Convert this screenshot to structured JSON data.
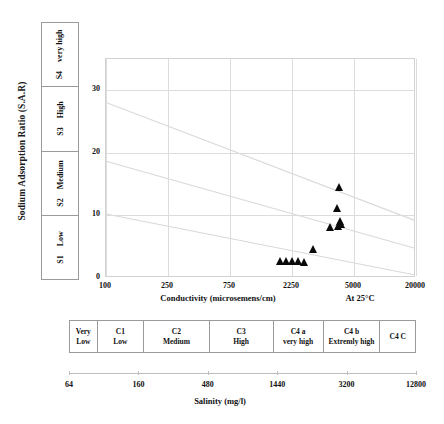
{
  "chart_data": {
    "type": "scatter",
    "title": "",
    "xlabel": "Conductivity (microsemens/cm)",
    "xlabel_extra": "At 25°C",
    "ylabel": "Sodium Adsorption Ratio (S.A.R)",
    "x_ticks": [
      "100",
      "250",
      "750",
      "2250",
      "5000",
      "20000"
    ],
    "x_tick_positions": [
      0,
      20,
      40,
      60,
      80,
      100
    ],
    "y_ticks": [
      "0",
      "10",
      "20",
      "30"
    ],
    "ylim": [
      0,
      35
    ],
    "grid": true,
    "legend": null,
    "secondary_axis": {
      "label": "Salinity (mg/l)",
      "ticks": [
        "64",
        "160",
        "480",
        "1440",
        "3200",
        "12800"
      ],
      "tick_positions": [
        0,
        20,
        40,
        60,
        80,
        100
      ]
    },
    "boundary_lines": [
      {
        "name": "S3-S4 boundary",
        "x0": 0,
        "y0": 28.0,
        "x1": 100,
        "y1": 9.0
      },
      {
        "name": "S2-S3 boundary",
        "x0": 0,
        "y0": 18.5,
        "x1": 100,
        "y1": 4.5
      },
      {
        "name": "S1-S2 boundary",
        "x0": 0,
        "y0": 10.0,
        "x1": 100,
        "y1": 0.2
      }
    ],
    "points": [
      {
        "x_pct": 56.2,
        "sar": 2.0
      },
      {
        "x_pct": 58.4,
        "sar": 2.1
      },
      {
        "x_pct": 60.3,
        "sar": 2.0
      },
      {
        "x_pct": 62.1,
        "sar": 2.1
      },
      {
        "x_pct": 64.2,
        "sar": 1.9
      },
      {
        "x_pct": 67.0,
        "sar": 4.0
      },
      {
        "x_pct": 72.5,
        "sar": 7.4
      },
      {
        "x_pct": 75.1,
        "sar": 7.6
      },
      {
        "x_pct": 75.6,
        "sar": 8.4
      },
      {
        "x_pct": 74.8,
        "sar": 10.5
      },
      {
        "x_pct": 75.4,
        "sar": 13.8
      },
      {
        "x_pct": 76.0,
        "sar": 7.9
      }
    ],
    "colors": {
      "marker": "#0a0a0a",
      "grid": "#dcdcdc",
      "boundary": "#d8d8d8",
      "border": "#9a9a9a",
      "text": "#111111"
    }
  },
  "sar_classes": [
    {
      "code": "S4",
      "label": "very high"
    },
    {
      "code": "S3",
      "label": "High"
    },
    {
      "code": "S2",
      "label": "Medium"
    },
    {
      "code": "S1",
      "label": "Low"
    }
  ],
  "salinity_classes": [
    {
      "code": "Very",
      "label": "Low",
      "width": 8.0
    },
    {
      "code": "C1",
      "label": "Low",
      "width": 13.5
    },
    {
      "code": "C2",
      "label": "Medium",
      "width": 19.0
    },
    {
      "code": "C3",
      "label": "High",
      "width": 18.5
    },
    {
      "code": "C4 a",
      "label": "very high",
      "width": 14.5
    },
    {
      "code": "C4 b",
      "label": "Extremly high",
      "width": 16.5
    },
    {
      "code": "C4 C",
      "label": "",
      "width": 10.0
    }
  ]
}
